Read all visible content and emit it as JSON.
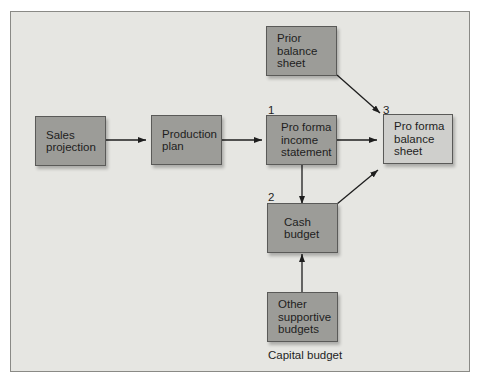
{
  "diagram": {
    "nodes": [
      {
        "id": "sales",
        "label": "Sales\nprojection"
      },
      {
        "id": "production",
        "label": "Production\nplan"
      },
      {
        "id": "prior",
        "label": "Prior balance\nsheet"
      },
      {
        "id": "income",
        "label": "Pro forma\nincome\nstatement",
        "step": "1"
      },
      {
        "id": "balance",
        "label": "Pro forma\nbalance\nsheet",
        "step": "3"
      },
      {
        "id": "cash",
        "label": "Cash\nbudget",
        "step": "2"
      },
      {
        "id": "other",
        "label": "Other\nsupportive\nbudgets"
      }
    ],
    "edges": [
      {
        "from": "sales",
        "to": "production"
      },
      {
        "from": "production",
        "to": "income"
      },
      {
        "from": "income",
        "to": "balance"
      },
      {
        "from": "prior",
        "to": "balance"
      },
      {
        "from": "income",
        "to": "cash"
      },
      {
        "from": "cash",
        "to": "balance"
      },
      {
        "from": "other",
        "to": "cash"
      }
    ],
    "caption": "Capital budget"
  }
}
